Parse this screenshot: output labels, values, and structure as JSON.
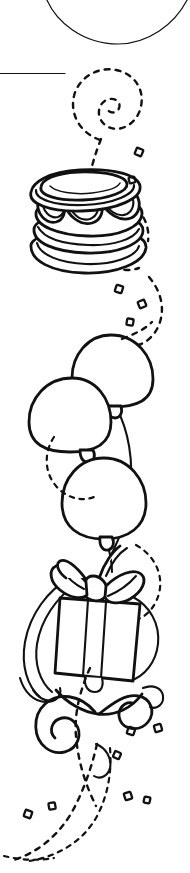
{
  "canvas": {
    "width": 190,
    "height": 873,
    "background_color": "#ffffff",
    "ink_color": "#111111",
    "title": "Birthday party border illustration",
    "style": "black and white line art clip art",
    "orientation": "vertical narrow strip"
  },
  "rules": {
    "top_arc_label": "top curved border arc",
    "horizontal_rule_label": "horizontal divider rule"
  },
  "elements": {
    "cake": {
      "label": "frosted layer cake on plate",
      "tiers": 1,
      "has_scalloped_frosting": true,
      "has_plate": true
    },
    "balloons": {
      "label": "cluster of balloons",
      "count": 3,
      "has_strings": true,
      "has_knots": true
    },
    "gift": {
      "label": "wrapped gift box with bow",
      "has_bow": true,
      "bow_loops": 2,
      "has_vertical_ribbon": true,
      "has_trailing_ribbons": true
    },
    "streamers": {
      "label": "curling ribbon streamers",
      "spiral_count": 3
    },
    "confetti": {
      "label": "scattered confetti pieces",
      "shape": "open diamond square",
      "count": 11
    },
    "dashed_trail": {
      "label": "dashed motion swirl trail",
      "style": "dashed"
    }
  },
  "confetti_positions": [
    {
      "x": 139,
      "y": 152,
      "r": 22,
      "s": 7
    },
    {
      "x": 132,
      "y": 180,
      "r": -14,
      "s": 6
    },
    {
      "x": 119,
      "y": 289,
      "r": 18,
      "s": 7
    },
    {
      "x": 142,
      "y": 304,
      "r": -22,
      "s": 7
    },
    {
      "x": 130,
      "y": 320,
      "r": 10,
      "s": 6.5
    },
    {
      "x": 131,
      "y": 731,
      "r": 18,
      "s": 7
    },
    {
      "x": 157,
      "y": 728,
      "r": -16,
      "s": 7
    },
    {
      "x": 117,
      "y": 755,
      "r": 24,
      "s": 6.5
    },
    {
      "x": 127,
      "y": 795,
      "r": -18,
      "s": 7
    },
    {
      "x": 126,
      "y": 793,
      "r": 12,
      "s": 6
    },
    {
      "x": 28,
      "y": 814,
      "r": 20,
      "s": 7
    }
  ]
}
